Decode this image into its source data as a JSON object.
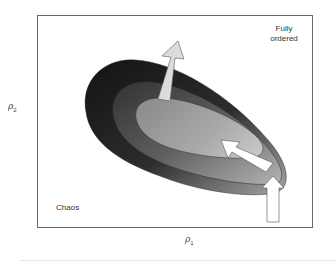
{
  "figure": {
    "x_axis": {
      "symbol": "ρ",
      "subscript": "1"
    },
    "y_axis": {
      "symbol": "ρ",
      "subscript": "2"
    },
    "labels": {
      "top_right_line1": "Fully",
      "top_right_line2": "ordered",
      "bottom_left": "Chaos"
    },
    "regions": [
      {
        "name": "outer",
        "color_dark": "#1c1a1a",
        "color_light": "#9a9a9a"
      },
      {
        "name": "middle",
        "color_dark": "#3a3a3a",
        "color_light": "#a8a8a8"
      },
      {
        "name": "inner",
        "color_dark": "#8c8c8c",
        "color_light": "#bdbdbd"
      }
    ],
    "arrows": [
      {
        "name": "upward-tilted-arrow",
        "fill": "#dcdcdc"
      },
      {
        "name": "diagonal-arrow",
        "fill": "#ffffff"
      },
      {
        "name": "vertical-arrow",
        "fill": "#ffffff"
      }
    ]
  }
}
